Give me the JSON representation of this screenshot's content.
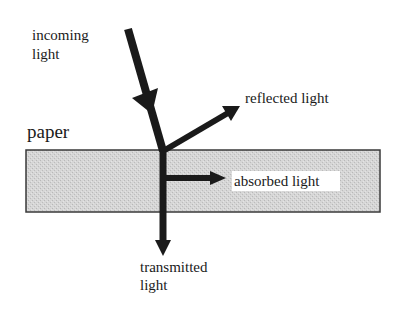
{
  "diagram": {
    "labels": {
      "incoming_line1": "incoming",
      "incoming_line2": "light",
      "paper": "paper",
      "reflected": "reflected light",
      "absorbed": "absorbed light",
      "transmitted_line1": "transmitted",
      "transmitted_line2": "light"
    },
    "colors": {
      "arrow": "#1a1a1a",
      "paper_fill": "#d4d4d4",
      "paper_border": "#3a3a3a",
      "background": "#ffffff"
    }
  }
}
